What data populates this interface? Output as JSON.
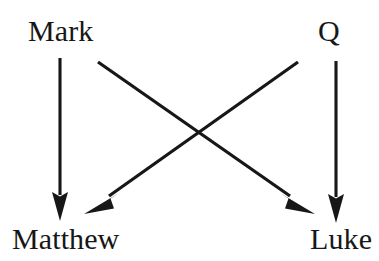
{
  "diagram": {
    "background_color": "#ffffff",
    "ink_color": "#171717",
    "nodes": [
      {
        "id": "mark",
        "label": "Mark",
        "position": "top-left",
        "x": 60,
        "y": 32
      },
      {
        "id": "q",
        "label": "Q",
        "position": "top-right",
        "x": 332,
        "y": 32
      },
      {
        "id": "matthew",
        "label": "Matthew",
        "position": "bottom-left",
        "x": 64,
        "y": 240
      },
      {
        "id": "luke",
        "label": "Luke",
        "position": "bottom-right",
        "x": 340,
        "y": 240
      }
    ],
    "edges": [
      {
        "id": "mark-to-matthew",
        "from": "Mark",
        "to": "Matthew",
        "kind": "vertical",
        "arrowhead": "solid-triangle",
        "x1": 60,
        "y1": 58,
        "x2": 60,
        "y2": 220
      },
      {
        "id": "mark-to-luke",
        "from": "Mark",
        "to": "Luke",
        "kind": "diagonal",
        "arrowhead": "solid-triangle",
        "x1": 98,
        "y1": 62,
        "x2": 314,
        "y2": 213
      },
      {
        "id": "q-to-matthew",
        "from": "Q",
        "to": "Matthew",
        "kind": "diagonal",
        "arrowhead": "solid-triangle",
        "x1": 298,
        "y1": 62,
        "x2": 85,
        "y2": 213
      },
      {
        "id": "q-to-luke",
        "from": "Q",
        "to": "Luke",
        "kind": "vertical",
        "arrowhead": "solid-triangle",
        "x1": 336,
        "y1": 61,
        "x2": 336,
        "y2": 222
      }
    ],
    "crossing_point": {
      "x": 199,
      "y": 137
    }
  }
}
